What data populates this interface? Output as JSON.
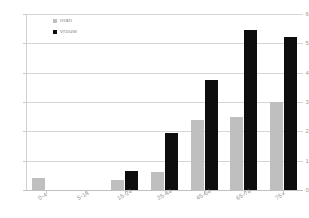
{
  "chart_data": {
    "type": "bar",
    "title": "",
    "subtitle": "",
    "xlabel": "",
    "ylabel": "",
    "categories": [
      "0-4",
      "5-14",
      "15-24",
      "25-44",
      "45-64",
      "65-74",
      "75+"
    ],
    "series": [
      {
        "name": "man",
        "color": "#bfbfbf",
        "values": [
          0.4,
          0,
          0.35,
          0.6,
          2.4,
          2.5,
          3.0
        ]
      },
      {
        "name": "vrouw",
        "color": "#0d0d0d",
        "values": [
          0,
          0,
          0.65,
          1.95,
          3.75,
          5.45,
          5.2
        ]
      }
    ],
    "ylim": [
      0,
      6
    ],
    "yticks": [
      0,
      1,
      2,
      3,
      4,
      5,
      6
    ],
    "ytick_labels": [
      "0",
      "1",
      "2",
      "3",
      "4",
      "5",
      "6"
    ],
    "grid": "horizontal",
    "legend_position": "top-left",
    "annotations": []
  },
  "legend": {
    "entries": [
      {
        "label": "man"
      },
      {
        "label": "vrouw"
      }
    ]
  },
  "colors": {
    "series_man": "#bfbfbf",
    "series_vrouw": "#0d0d0d",
    "gridline": "#d6d6d6",
    "axis": "#c9c9c9",
    "text": "#9a9a9a",
    "background": "#ffffff"
  }
}
